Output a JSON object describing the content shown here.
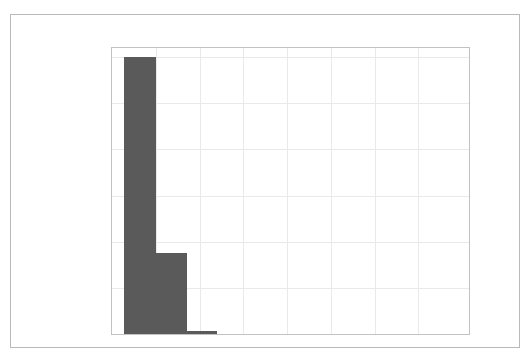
{
  "figure": {
    "background_color": "#ffffff",
    "frame_color": "#b9b9b9",
    "axes_edge_color": "#c2c2c2",
    "grid_color": "#e9e9e9",
    "bar_color": "#5a5a5a",
    "tick_label_color": "#4a4a4a"
  },
  "chart_data": {
    "type": "bar",
    "title": "",
    "xlabel": "",
    "ylabel": "",
    "xlim": [
      0,
      163.2
    ],
    "ylim": [
      0,
      31000
    ],
    "grid": true,
    "legend": null,
    "legend_position": "none",
    "bin_edges": [
      5.5,
      20.0,
      34.5,
      48.0
    ],
    "bins": [
      {
        "label": "5.5–20",
        "x_start": 5.5,
        "x_end": 20.0,
        "value": 30000
      },
      {
        "label": "20–34.5",
        "x_start": 20.0,
        "x_end": 34.5,
        "value": 8800
      },
      {
        "label": "34.5–48",
        "x_start": 34.5,
        "x_end": 48.0,
        "value": 300
      }
    ],
    "categories": [
      "5.5–20",
      "20–34.5",
      "34.5–48"
    ],
    "values": [
      30000,
      8800,
      300
    ],
    "xticks": [
      {
        "value": 0,
        "label": "0"
      },
      {
        "value": 20,
        "label": "20"
      },
      {
        "value": 40,
        "label": "40"
      },
      {
        "value": 60,
        "label": "60"
      },
      {
        "value": 80,
        "label": "80"
      },
      {
        "value": 100,
        "label": "100"
      },
      {
        "value": 120,
        "label": "120"
      },
      {
        "value": 140,
        "label": "140"
      }
    ],
    "yticks": [
      {
        "value": 0,
        "label": "0"
      },
      {
        "value": 5000,
        "label": "5000"
      },
      {
        "value": 10000,
        "label": "10000"
      },
      {
        "value": 15000,
        "label": "15000"
      },
      {
        "value": 20000,
        "label": "20000"
      },
      {
        "value": 25000,
        "label": "25000"
      },
      {
        "value": 30000,
        "label": "30000"
      }
    ]
  }
}
